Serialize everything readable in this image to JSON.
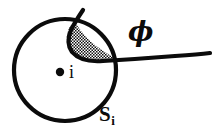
{
  "figure": {
    "kind": "diagram",
    "background_color": "#ffffff",
    "stroke_color": "#0b0b0b",
    "labels": {
      "curve": "ϕ",
      "region": "S",
      "region_subscript": "i",
      "center_point": "i"
    },
    "shading": {
      "fill_pattern": "stipple-checker",
      "pattern_color": "#111111",
      "pattern_background": "#ffffff"
    },
    "geometry": {
      "circle_center_x": 65,
      "circle_center_y": 70,
      "circle_radius": 51,
      "circle_stroke_width": 4,
      "center_dot_x": 60,
      "center_dot_y": 72,
      "center_dot_radius": 4,
      "curve_stroke_width": 4
    }
  }
}
